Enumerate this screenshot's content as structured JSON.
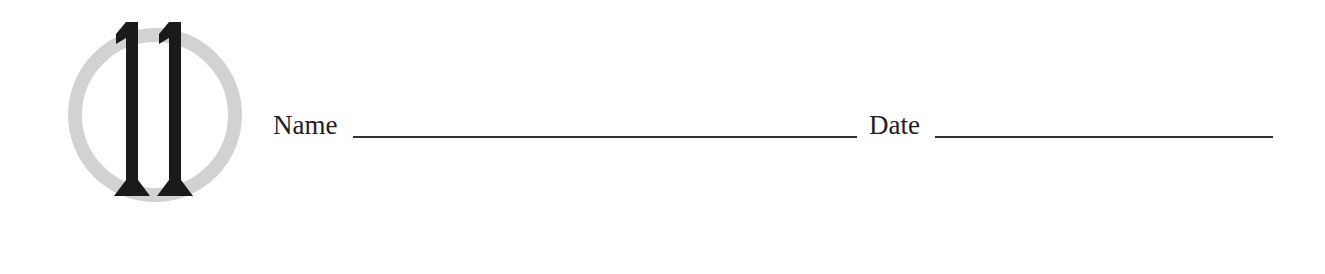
{
  "header": {
    "chapter_number": "11",
    "emblem": {
      "ring_color": "#d2d2d2",
      "numeral_color": "#1a1a1a"
    }
  },
  "fields": {
    "name_label": "Name",
    "name_value": "",
    "date_label": "Date",
    "date_value": ""
  }
}
